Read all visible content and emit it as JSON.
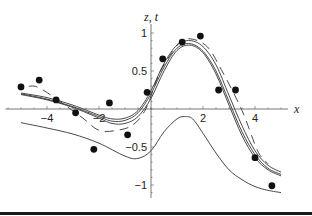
{
  "chart_data": {
    "type": "scatter",
    "title": "",
    "xlabel": "x",
    "ylabel": "z, t",
    "xlim": [
      -5.6,
      5.8
    ],
    "ylim": [
      -1.2,
      1.1
    ],
    "x_ticks": [
      {
        "value": -4,
        "label": "-4"
      },
      {
        "value": -2,
        "label": "-2"
      },
      {
        "value": 2,
        "label": "2"
      },
      {
        "value": 4,
        "label": "4"
      }
    ],
    "y_ticks": [
      {
        "value": 1,
        "label": "1"
      },
      {
        "value": 0.5,
        "label": "0.5"
      },
      {
        "value": -0.5,
        "label": "-0.5"
      },
      {
        "value": -1,
        "label": "-1"
      }
    ],
    "grid": false,
    "legend": null,
    "series": [
      {
        "name": "data points",
        "kind": "scatter",
        "x": [
          -5.0,
          -4.3,
          -3.65,
          -2.9,
          -2.2,
          -1.6,
          -0.9,
          -0.15,
          0.45,
          1.2,
          1.9,
          2.6,
          3.25,
          4.0,
          4.65
        ],
        "y": [
          0.29,
          0.38,
          0.12,
          -0.05,
          -0.53,
          0.08,
          -0.34,
          0.22,
          0.66,
          0.88,
          0.96,
          0.25,
          0.25,
          -0.64,
          -1.01
        ]
      },
      {
        "name": "fit curve 1 (solid)",
        "kind": "line",
        "x": [
          -5,
          -4,
          -3,
          -2,
          -1.5,
          -1,
          -0.5,
          0,
          0.5,
          1,
          1.5,
          2,
          2.5,
          3,
          3.5,
          4,
          4.5,
          5
        ],
        "y": [
          0.2,
          0.13,
          0.03,
          -0.1,
          -0.16,
          -0.15,
          -0.05,
          0.2,
          0.55,
          0.8,
          0.86,
          0.76,
          0.5,
          0.1,
          -0.3,
          -0.6,
          -0.78,
          -0.86
        ]
      },
      {
        "name": "fit curve 2 (solid)",
        "kind": "line",
        "x": [
          -5,
          -4,
          -3,
          -2,
          -1.5,
          -1,
          -0.5,
          0,
          0.5,
          1,
          1.5,
          2,
          2.5,
          3,
          3.5,
          4,
          4.5,
          5
        ],
        "y": [
          0.21,
          0.15,
          0.05,
          -0.08,
          -0.13,
          -0.12,
          -0.02,
          0.24,
          0.6,
          0.84,
          0.9,
          0.82,
          0.58,
          0.18,
          -0.22,
          -0.55,
          -0.74,
          -0.83
        ]
      },
      {
        "name": "fit curve 3 (solid)",
        "kind": "line",
        "x": [
          -5,
          -4,
          -3,
          -2,
          -1.5,
          -1,
          -0.5,
          0,
          0.5,
          1,
          1.5,
          2,
          2.5,
          3,
          3.5,
          4,
          4.5,
          5
        ],
        "y": [
          0.19,
          0.12,
          0.02,
          -0.12,
          -0.19,
          -0.19,
          -0.1,
          0.14,
          0.5,
          0.77,
          0.84,
          0.74,
          0.46,
          0.05,
          -0.35,
          -0.64,
          -0.8,
          -0.88
        ]
      },
      {
        "name": "dashed curve",
        "kind": "line-dashed",
        "x": [
          -4.7,
          -4.2,
          -2.7,
          -2.0,
          -1.3,
          -0.7,
          -0.2,
          0.3,
          0.8,
          1.3,
          2.1,
          2.7,
          3.5,
          4.1,
          4.5
        ],
        "y": [
          0.3,
          0.26,
          -0.1,
          -0.28,
          -0.28,
          -0.21,
          0.0,
          0.45,
          0.74,
          0.92,
          0.84,
          0.52,
          -0.02,
          -0.55,
          -0.72
        ]
      },
      {
        "name": "lower curve t (solid)",
        "kind": "line",
        "x": [
          -5,
          -4,
          -3,
          -2,
          -1,
          -0.5,
          0,
          0.5,
          1,
          1.3,
          1.6,
          2,
          2.5,
          3,
          3.5,
          4,
          4.5,
          5
        ],
        "y": [
          -0.18,
          -0.25,
          -0.33,
          -0.45,
          -0.62,
          -0.65,
          -0.55,
          -0.3,
          -0.13,
          -0.1,
          -0.13,
          -0.32,
          -0.58,
          -0.8,
          -0.93,
          -1.02,
          -1.07,
          -1.1
        ]
      }
    ]
  }
}
